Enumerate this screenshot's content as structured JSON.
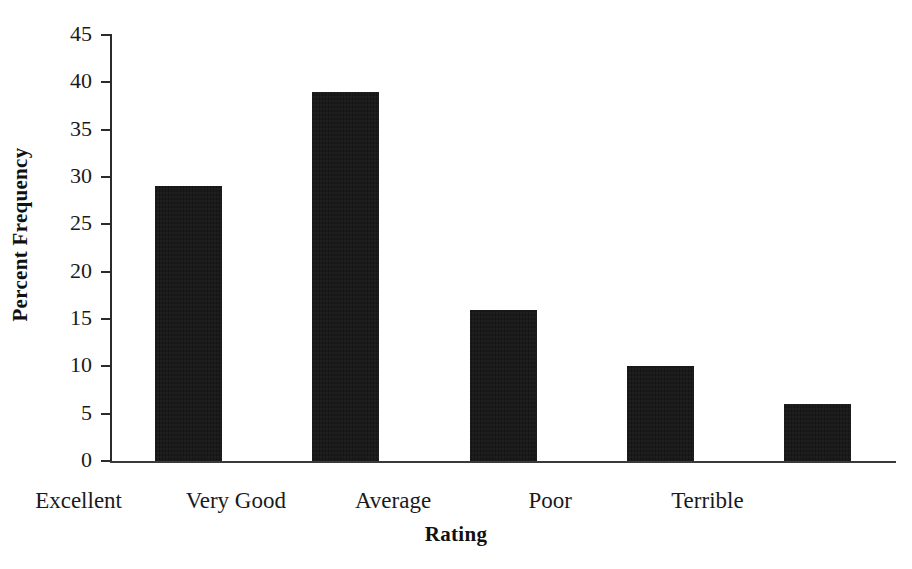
{
  "chart_data": {
    "type": "bar",
    "title": "",
    "subtitle": "",
    "xlabel": "Rating",
    "ylabel": "Percent Frequency",
    "categories": [
      "Excellent",
      "Very Good",
      "Average",
      "Poor",
      "Terrible"
    ],
    "values": [
      29,
      39,
      16,
      10,
      6
    ],
    "series": [
      {
        "name": "Percent Frequency",
        "values": [
          29,
          39,
          16,
          10,
          6
        ]
      }
    ],
    "ylim": [
      0,
      45
    ],
    "ytick_step": 5,
    "ytick_labels": [
      "0",
      "5",
      "10",
      "15",
      "20",
      "25",
      "30",
      "35",
      "40",
      "45"
    ],
    "ytick_values": [
      0,
      5,
      10,
      15,
      20,
      25,
      30,
      35,
      40,
      45
    ],
    "grid": false,
    "legend": null,
    "legend_position": "none",
    "annotations": [],
    "bar_color": "#141414",
    "axis_color": "#2b2b2b",
    "background_color": "#ffffff"
  }
}
